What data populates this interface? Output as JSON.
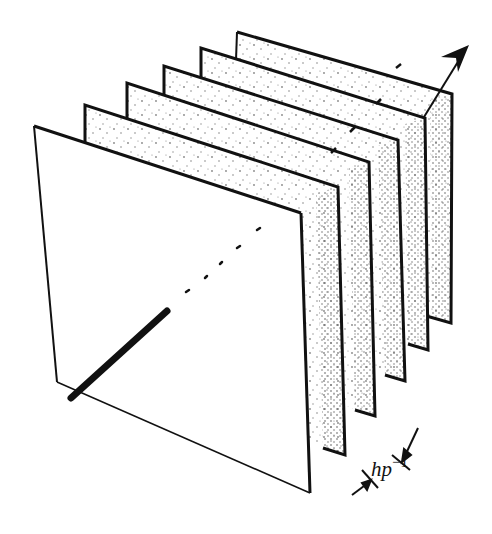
{
  "figure": {
    "colors": {
      "ink": "#111111",
      "background": "#ffffff"
    },
    "planes": [
      {
        "id": "plane-6",
        "corners": [
          [
            237,
            32
          ],
          [
            452,
            94
          ],
          [
            451,
            323
          ],
          [
            236,
            262
          ]
        ],
        "stippled": true
      },
      {
        "id": "plane-5",
        "corners": [
          [
            201,
            48
          ],
          [
            425,
            118
          ],
          [
            428,
            350
          ],
          [
            201,
            282
          ]
        ],
        "stippled": true
      },
      {
        "id": "plane-4",
        "corners": [
          [
            164,
            66
          ],
          [
            398,
            140
          ],
          [
            405,
            381
          ],
          [
            165,
            305
          ]
        ],
        "stippled": true
      },
      {
        "id": "plane-3",
        "corners": [
          [
            127,
            83
          ],
          [
            369,
            162
          ],
          [
            375,
            416
          ],
          [
            127,
            330
          ]
        ],
        "stippled": true
      },
      {
        "id": "plane-2",
        "corners": [
          [
            85,
            105
          ],
          [
            338,
            187
          ],
          [
            345,
            455
          ],
          [
            85,
            355
          ]
        ],
        "stippled": true
      },
      {
        "id": "plane-1-front",
        "corners": [
          [
            34,
            126
          ],
          [
            301,
            213
          ],
          [
            310,
            493
          ],
          [
            57,
            382
          ]
        ],
        "stippled": false
      }
    ],
    "rod": {
      "from": [
        71,
        398
      ],
      "to": [
        168,
        311
      ]
    },
    "beam_dashes": [
      [
        183,
        289
      ],
      [
        205,
        270
      ],
      [
        221,
        256
      ],
      [
        239,
        247
      ],
      [
        258,
        230
      ],
      [
        277,
        213
      ],
      [
        300,
        195
      ],
      [
        330,
        170
      ],
      [
        356,
        150
      ],
      [
        382,
        128
      ],
      [
        405,
        105
      ]
    ],
    "arrow": {
      "from": [
        424,
        117
      ],
      "to": [
        469,
        45
      ]
    },
    "spacing_label": {
      "text": "hp",
      "superscript": "−1"
    }
  }
}
